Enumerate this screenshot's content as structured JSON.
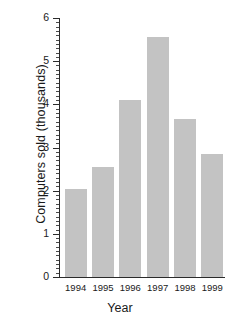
{
  "chart_data": {
    "type": "bar",
    "title": "",
    "xlabel": "Year",
    "ylabel": "Computers sold (thousands)",
    "categories": [
      "1994",
      "1995",
      "1996",
      "1997",
      "1998",
      "1999"
    ],
    "values": [
      2.05,
      2.55,
      4.1,
      5.55,
      3.65,
      2.85
    ],
    "ylim": [
      0,
      6
    ],
    "ytick_labels": [
      "0",
      "1",
      "2",
      "3",
      "4",
      "5",
      "6"
    ],
    "ytick_values": [
      0,
      1,
      2,
      3,
      4,
      5,
      6
    ],
    "minor_tick_step": 0.1,
    "grid": false,
    "legend": null,
    "bar_color": "#c3c3c3",
    "axis_color": "#2b2b2b",
    "background": "#ffffff"
  }
}
